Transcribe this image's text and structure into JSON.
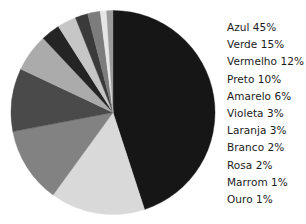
{
  "chart_data": {
    "type": "pie",
    "title": "",
    "xlabel": "",
    "ylabel": "",
    "legend_position": "right",
    "grid": false,
    "units": "percent",
    "start_angle_deg": 0,
    "direction": "clockwise",
    "categories": [
      "Azul",
      "Verde",
      "Vermelho",
      "Preto",
      "Amarelo",
      "Violeta",
      "Laranja",
      "Branco",
      "Rosa",
      "Marrom",
      "Ouro"
    ],
    "values": [
      45,
      15,
      12,
      10,
      6,
      3,
      3,
      2,
      2,
      1,
      1
    ],
    "total": 100,
    "slices": [
      {
        "label": "Azul",
        "value": 45,
        "percent_text": "45%",
        "color": "#161616"
      },
      {
        "label": "Verde",
        "value": 15,
        "percent_text": "15%",
        "color": "#d9d9d9"
      },
      {
        "label": "Vermelho",
        "value": 12,
        "percent_text": "12%",
        "color": "#828282"
      },
      {
        "label": "Preto",
        "value": 10,
        "percent_text": "10%",
        "color": "#4a4a4a"
      },
      {
        "label": "Amarelo",
        "value": 6,
        "percent_text": "6%",
        "color": "#ababab"
      },
      {
        "label": "Violeta",
        "value": 3,
        "percent_text": "3%",
        "color": "#242424"
      },
      {
        "label": "Laranja",
        "value": 3,
        "percent_text": "3%",
        "color": "#c6c6c6"
      },
      {
        "label": "Branco",
        "value": 2,
        "percent_text": "2%",
        "color": "#3a3a3a"
      },
      {
        "label": "Rosa",
        "value": 2,
        "percent_text": "2%",
        "color": "#7c7c7c"
      },
      {
        "label": "Marrom",
        "value": 1,
        "percent_text": "1%",
        "color": "#e6e6e6"
      },
      {
        "label": "Ouro",
        "value": 1,
        "percent_text": "1%",
        "color": "#9b9b9b"
      }
    ]
  },
  "legend": {
    "entries": [
      {
        "text": "Azul 45%"
      },
      {
        "text": "Verde 15%"
      },
      {
        "text": "Vermelho 12%"
      },
      {
        "text": "Preto 10%"
      },
      {
        "text": "Amarelo 6%"
      },
      {
        "text": "Violeta 3%"
      },
      {
        "text": "Laranja 3%"
      },
      {
        "text": "Branco 2%"
      },
      {
        "text": "Rosa 2%"
      },
      {
        "text": "Marrom 1%"
      },
      {
        "text": "Ouro 1%"
      }
    ]
  },
  "geometry": {
    "center_x": 105,
    "center_y": 104.5,
    "radius": 102
  }
}
